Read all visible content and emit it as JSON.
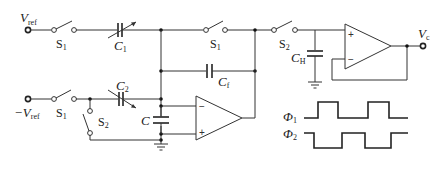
{
  "diagram": {
    "terminals": {
      "vref_pos": {
        "label": "V",
        "sub": "ref"
      },
      "vref_neg": {
        "label": "−V",
        "sub": "ref"
      },
      "output": {
        "label": "V",
        "sub": "c"
      }
    },
    "switches": [
      {
        "id": "S1_top_left",
        "label": "S",
        "sub": "1"
      },
      {
        "id": "S1_top_mid",
        "label": "S",
        "sub": "1"
      },
      {
        "id": "S2_top_right",
        "label": "S",
        "sub": "2"
      },
      {
        "id": "S1_bottom",
        "label": "S",
        "sub": "1"
      },
      {
        "id": "S2_bottom",
        "label": "S",
        "sub": "2"
      }
    ],
    "capacitors": [
      {
        "id": "C1",
        "label": "C",
        "sub": "1",
        "variable": true
      },
      {
        "id": "C2",
        "label": "C",
        "sub": "2",
        "variable": true
      },
      {
        "id": "Cf",
        "label": "C",
        "sub": "f"
      },
      {
        "id": "C",
        "label": "C",
        "sub": ""
      },
      {
        "id": "CH",
        "label": "C",
        "sub": "H"
      }
    ],
    "opamps": [
      {
        "id": "integrator",
        "inv": "−",
        "noninv": "+"
      },
      {
        "id": "buffer",
        "inv": "−",
        "noninv": "+"
      }
    ],
    "clocks": [
      {
        "label": "Φ",
        "sub": "1"
      },
      {
        "label": "Φ",
        "sub": "2"
      }
    ]
  }
}
